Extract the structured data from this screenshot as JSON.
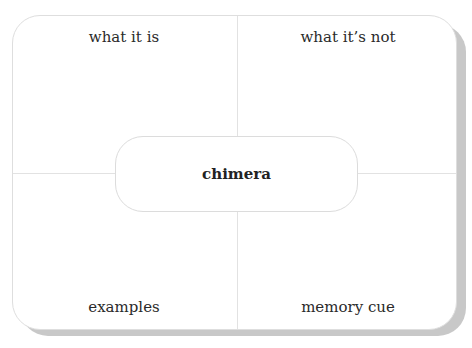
{
  "diagram": {
    "type": "frayer-model",
    "center_term": "chimera",
    "quadrants": {
      "top_left": "what it is",
      "top_right": "what it’s not",
      "bottom_left": "examples",
      "bottom_right": "memory cue"
    }
  }
}
